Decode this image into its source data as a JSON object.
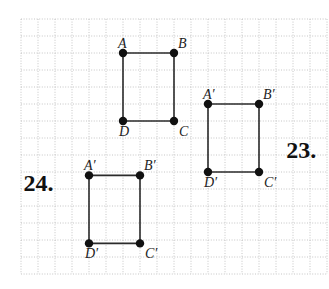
{
  "diagram": {
    "type": "coordinate-grid-translation",
    "grid": {
      "columns": 18,
      "rows": 15,
      "style": "dotted"
    },
    "colors": {
      "grid": "#b8b8b8",
      "edge": "#2b2b2b",
      "vertex": "#111111"
    },
    "figures": [
      {
        "id": "original",
        "problem_label": "",
        "vertices": [
          {
            "name": "A",
            "col": 6,
            "row": 2,
            "label_pos": "upper-left"
          },
          {
            "name": "B",
            "col": 9,
            "row": 2,
            "label_pos": "upper-right"
          },
          {
            "name": "C",
            "col": 9,
            "row": 6,
            "label_pos": "lower-right"
          },
          {
            "name": "D",
            "col": 6,
            "row": 6,
            "label_pos": "lower-left"
          }
        ]
      },
      {
        "id": "image-23",
        "problem_label": "23.",
        "problem_label_cell": {
          "col": 15.6,
          "row": 8.2
        },
        "vertices": [
          {
            "name": "A′",
            "col": 11,
            "row": 5,
            "label_pos": "upper-left"
          },
          {
            "name": "B′",
            "col": 14,
            "row": 5,
            "label_pos": "upper-right"
          },
          {
            "name": "C′",
            "col": 14,
            "row": 9,
            "label_pos": "lower-right"
          },
          {
            "name": "D′",
            "col": 11,
            "row": 9,
            "label_pos": "lower-left"
          }
        ]
      },
      {
        "id": "image-24",
        "problem_label": "24.",
        "problem_label_cell": {
          "col": 0.15,
          "row": 10.1
        },
        "vertices": [
          {
            "name": "A′",
            "col": 4,
            "row": 9.2,
            "label_pos": "upper-left"
          },
          {
            "name": "B′",
            "col": 7,
            "row": 9.2,
            "label_pos": "upper-right"
          },
          {
            "name": "C′",
            "col": 7,
            "row": 13.2,
            "label_pos": "lower-right"
          },
          {
            "name": "D′",
            "col": 4,
            "row": 13.2,
            "label_pos": "lower-left"
          }
        ]
      }
    ]
  }
}
